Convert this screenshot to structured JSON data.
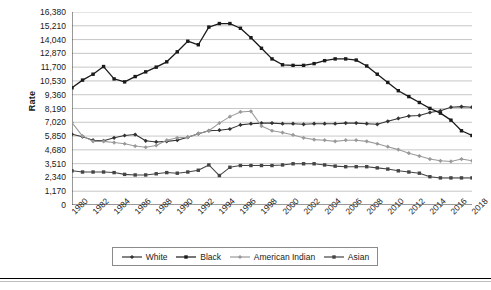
{
  "chart_data": {
    "type": "line",
    "title": "",
    "xlabel": "",
    "ylabel": "Rate",
    "ylim": [
      0,
      16380
    ],
    "ytick_step": 1170,
    "ytick_labels": [
      "0",
      "1,170",
      "2,340",
      "3,510",
      "4,680",
      "5,850",
      "7,020",
      "8,190",
      "9,360",
      "10,530",
      "11,700",
      "12,870",
      "14,040",
      "15,210",
      "16,380"
    ],
    "grid": true,
    "legend_position": "bottom",
    "x": [
      1980,
      1981,
      1982,
      1983,
      1984,
      1985,
      1986,
      1987,
      1988,
      1989,
      1990,
      1991,
      1992,
      1993,
      1994,
      1995,
      1996,
      1997,
      1998,
      1999,
      2000,
      2001,
      2002,
      2003,
      2004,
      2005,
      2006,
      2007,
      2008,
      2009,
      2010,
      2011,
      2012,
      2013,
      2014,
      2015,
      2016,
      2017,
      2018
    ],
    "xtick_labels": [
      "1980",
      "1982",
      "1984",
      "1986",
      "1988",
      "1990",
      "1992",
      "1994",
      "1996",
      "1998",
      "2000",
      "2002",
      "2004",
      "2006",
      "2008",
      "2010",
      "2012",
      "2014",
      "2016",
      "2018"
    ],
    "series": [
      {
        "name": "White",
        "color": "#333333",
        "marker": "diamond",
        "values": [
          6000,
          5800,
          5500,
          5450,
          5700,
          5900,
          5980,
          5450,
          5350,
          5400,
          5500,
          5750,
          6050,
          6300,
          6350,
          6450,
          6800,
          6900,
          6950,
          6950,
          6900,
          6900,
          6850,
          6900,
          6900,
          6900,
          6950,
          6950,
          6900,
          6850,
          7100,
          7350,
          7550,
          7600,
          7850,
          8000,
          8300,
          8350,
          8300
        ]
      },
      {
        "name": "Black",
        "color": "#1a1a1a",
        "marker": "square",
        "values": [
          9950,
          10600,
          11100,
          11750,
          10700,
          10450,
          10900,
          11300,
          11700,
          12150,
          13000,
          13900,
          13600,
          15100,
          15400,
          15400,
          15000,
          14200,
          13300,
          12400,
          11900,
          11850,
          11850,
          12000,
          12250,
          12400,
          12400,
          12300,
          11800,
          11100,
          10400,
          9700,
          9200,
          8700,
          8200,
          7800,
          7200,
          6300,
          5900
        ]
      },
      {
        "name": "American Indian",
        "color": "#9a9a9a",
        "marker": "diamond",
        "values": [
          7000,
          5850,
          5400,
          5400,
          5300,
          5200,
          5000,
          4900,
          5050,
          5500,
          5700,
          5750,
          6050,
          6300,
          6950,
          7500,
          7900,
          7950,
          6700,
          6300,
          6150,
          5950,
          5700,
          5550,
          5500,
          5400,
          5500,
          5500,
          5400,
          5200,
          4950,
          4700,
          4400,
          4150,
          3900,
          3750,
          3700,
          3900,
          3750
        ]
      },
      {
        "name": "Asian",
        "color": "#444444",
        "marker": "square",
        "values": [
          2900,
          2800,
          2800,
          2800,
          2750,
          2600,
          2550,
          2550,
          2650,
          2750,
          2700,
          2800,
          2950,
          3400,
          2500,
          3200,
          3350,
          3350,
          3350,
          3350,
          3400,
          3500,
          3500,
          3500,
          3400,
          3300,
          3250,
          3250,
          3250,
          3150,
          3050,
          2900,
          2800,
          2700,
          2400,
          2300,
          2300,
          2300,
          2300
        ]
      }
    ]
  }
}
